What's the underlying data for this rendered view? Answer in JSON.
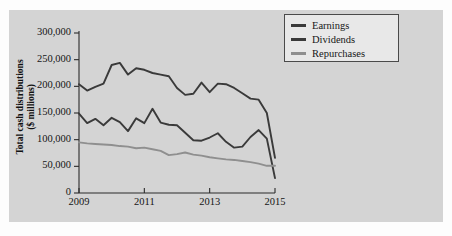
{
  "figure": {
    "background_color": "#d4d4d4",
    "outer_color": "#fdfdfd"
  },
  "axes": {
    "y_title_line1": "Total cash distributions",
    "y_title_line2": "($ millions)",
    "y_ticks": [
      "0",
      "50,000",
      "100,000",
      "150,000",
      "200,000",
      "250,000",
      "300,000"
    ],
    "x_ticks": [
      "2009",
      "2011",
      "2013",
      "2015"
    ],
    "x_title": ""
  },
  "legend": {
    "items": [
      {
        "label": "Earnings",
        "color": "#3a3a3a"
      },
      {
        "label": "Dividends",
        "color": "#3a3a3a"
      },
      {
        "label": "Repurchases",
        "color": "#8f8f8f"
      }
    ]
  },
  "chart_data": {
    "type": "line",
    "title": "",
    "xlabel": "",
    "ylabel": "Total cash distributions ($ millions)",
    "xlim": [
      2009,
      2015
    ],
    "ylim": [
      0,
      300000
    ],
    "grid": false,
    "legend_position": "top-right",
    "x_tick_values": [
      2009,
      2011,
      2013,
      2015
    ],
    "y_tick_values": [
      0,
      50000,
      100000,
      150000,
      200000,
      250000,
      300000
    ],
    "x": [
      2009.0,
      2009.25,
      2009.5,
      2009.75,
      2010.0,
      2010.25,
      2010.5,
      2010.75,
      2011.0,
      2011.25,
      2011.5,
      2011.75,
      2012.0,
      2012.25,
      2012.5,
      2012.75,
      2013.0,
      2013.25,
      2013.5,
      2013.75,
      2014.0,
      2014.25,
      2014.5,
      2014.75,
      2015.0
    ],
    "series": [
      {
        "name": "Earnings",
        "color": "#3a3a3a",
        "values": [
          204000,
          192000,
          199000,
          205000,
          240000,
          244000,
          222000,
          234000,
          231000,
          225000,
          222000,
          219000,
          197000,
          184000,
          186000,
          207000,
          189000,
          205000,
          204000,
          197000,
          187000,
          177000,
          175000,
          150000,
          66000
        ]
      },
      {
        "name": "Dividends",
        "color": "#3a3a3a",
        "values": [
          149000,
          131000,
          139000,
          127000,
          141000,
          133000,
          116000,
          140000,
          131000,
          158000,
          132000,
          128000,
          127000,
          113000,
          99000,
          98000,
          104000,
          112000,
          96000,
          85000,
          87000,
          105000,
          118000,
          102000,
          28000
        ]
      },
      {
        "name": "Repurchases",
        "color": "#8f8f8f",
        "values": [
          95000,
          93000,
          92000,
          91000,
          90000,
          88000,
          87000,
          84000,
          85000,
          82000,
          79000,
          71000,
          73000,
          76000,
          72000,
          70000,
          67000,
          65000,
          63000,
          62000,
          60000,
          58000,
          55000,
          51000,
          51000
        ]
      }
    ]
  }
}
